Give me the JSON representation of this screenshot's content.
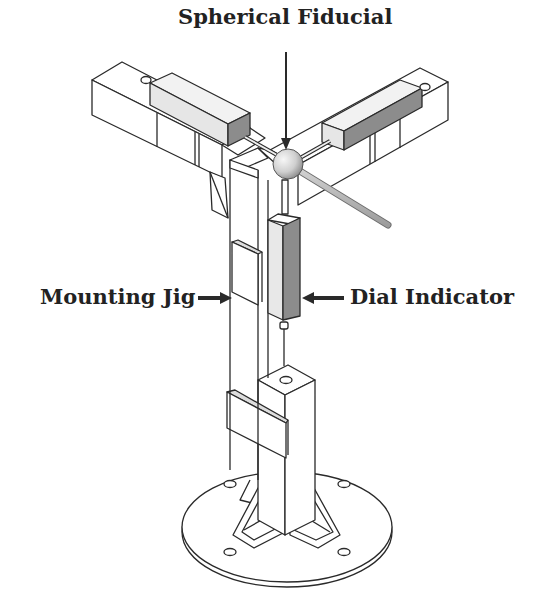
{
  "figure": {
    "type": "isometric line drawing",
    "labels": {
      "spherical_fiducial": "Spherical Fiducial",
      "mounting_jig": "Mounting Jig",
      "dial_indicator": "Dial Indicator"
    },
    "colors": {
      "line": "#2a2a2a",
      "light_face": "#e8e8e8",
      "mid_face": "#bdbdbd",
      "dark_face": "#8c8c8c",
      "sphere_light": "#f2f2f2",
      "sphere_dark": "#9a9a9a",
      "rod": "#b0b0b0",
      "text": "#222222",
      "background": "#ffffff"
    }
  }
}
